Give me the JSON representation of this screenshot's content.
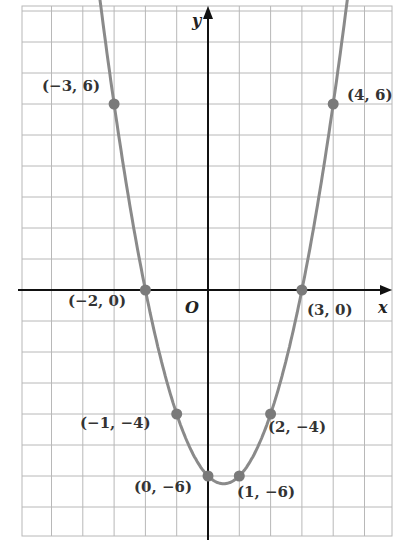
{
  "chart_data": {
    "type": "line",
    "title": "",
    "xlabel": "x",
    "ylabel": "y",
    "origin_label": "O",
    "function": "y = x^2 - x - 6",
    "xlim": [
      -6,
      6
    ],
    "ylim": [
      -8,
      9
    ],
    "grid": true,
    "points": [
      {
        "x": -3,
        "y": 6,
        "label": "(−3, 6)"
      },
      {
        "x": -2,
        "y": 0,
        "label": "(−2, 0)"
      },
      {
        "x": -1,
        "y": -4,
        "label": "(−1, −4)"
      },
      {
        "x": 0,
        "y": -6,
        "label": "(0, −6)"
      },
      {
        "x": 1,
        "y": -6,
        "label": "(1, −6)"
      },
      {
        "x": 2,
        "y": -4,
        "label": "(2, −4)"
      },
      {
        "x": 3,
        "y": 0,
        "label": "(3, 0)"
      },
      {
        "x": 4,
        "y": 6,
        "label": "(4, 6)"
      }
    ]
  },
  "colors": {
    "curve": "#8a8a8a",
    "point": "#7a7a7a",
    "grid": "#b8b8b8",
    "axis": "#111111"
  }
}
